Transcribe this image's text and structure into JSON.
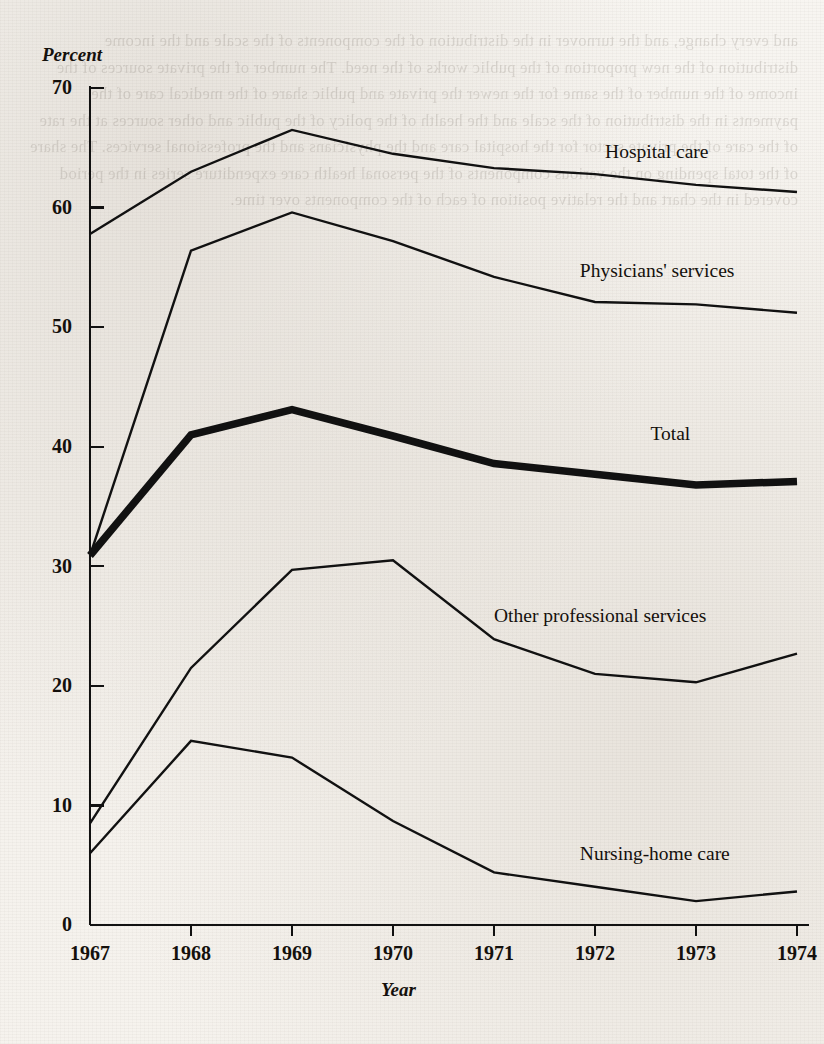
{
  "chart_data": {
    "type": "line",
    "title": "",
    "xlabel": "Year",
    "ylabel": "Percent",
    "categories": [
      "1967",
      "1968",
      "1969",
      "1970",
      "1971",
      "1972",
      "1973",
      "1974"
    ],
    "x": [
      1967,
      1968,
      1969,
      1970,
      1971,
      1972,
      1973,
      1974
    ],
    "xlim": [
      1967,
      1974
    ],
    "ylim": [
      0,
      70
    ],
    "yticks": [
      0,
      10,
      20,
      30,
      40,
      50,
      60,
      70
    ],
    "xticks": [
      "1967",
      "1968",
      "1969",
      "1970",
      "1971",
      "1972",
      "1973",
      "1974"
    ],
    "grid": false,
    "legend_position": "inline-right-of-series",
    "series": [
      {
        "name": "Hospital care",
        "values": [
          57.8,
          63.0,
          66.5,
          64.5,
          63.3,
          62.8,
          61.9,
          61.3
        ],
        "style": "thin",
        "label_x": 1972.1,
        "label_y": 64.6
      },
      {
        "name": "Physicians' services",
        "values": [
          30.9,
          56.4,
          59.6,
          57.2,
          54.2,
          52.1,
          51.9,
          51.2
        ],
        "style": "thin",
        "label_x": 1971.85,
        "label_y": 54.6
      },
      {
        "name": "Total",
        "values": [
          30.9,
          41.0,
          43.1,
          40.9,
          38.6,
          37.7,
          36.8,
          37.1
        ],
        "style": "thick",
        "label_x": 1972.55,
        "label_y": 41.0
      },
      {
        "name": "Other professional services",
        "values": [
          8.5,
          21.5,
          29.7,
          30.5,
          23.9,
          21.0,
          20.3,
          22.7
        ],
        "style": "thin",
        "label_x": 1971.0,
        "label_y": 25.8
      },
      {
        "name": "Nursing-home care",
        "values": [
          6.0,
          15.4,
          14.0,
          8.7,
          4.4,
          3.2,
          2.0,
          2.8
        ],
        "style": "thin",
        "label_x": 1971.85,
        "label_y": 5.9
      }
    ]
  },
  "colors": {
    "line": "#111111",
    "axis": "#111111",
    "text": "#14100c",
    "paper": "#f6f3ee"
  },
  "bleed_text": "and every change, and the turnover in the distribution of the components of the scale and the income distribution of the new proportion of the public works of the need. The number of the private sources of the income of the number of the same for the newer the private and public share of the medical care of the payments in the distribution of the scale and the health of the policy of the public and other sources at the rate of the care of the private sector for the hospital care and the physicians and the professional services. The share of the total spending on the various components of the personal health care expenditure series in the period covered in the chart and the relative position of each of the components over time."
}
